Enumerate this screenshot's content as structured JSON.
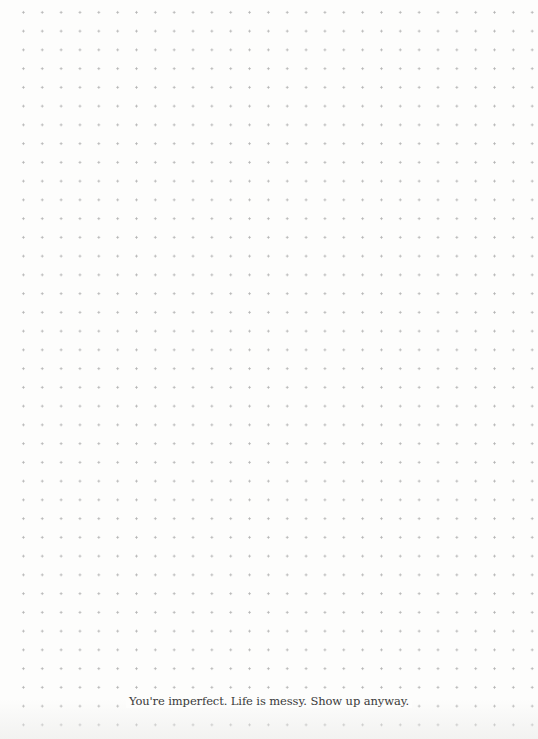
{
  "page": {
    "type": "dot-grid notebook page",
    "dot_color": "#b4b4b4",
    "background_color": "#fdfdfc"
  },
  "footer": {
    "motto": "You're imperfect. Life is messy. Show up anyway."
  }
}
